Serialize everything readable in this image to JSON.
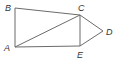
{
  "diagram": {
    "type": "geometry",
    "stroke_color": "#6b6b6b",
    "label_color": "#333333",
    "points": {
      "A": {
        "label": "A",
        "x": 15,
        "y": 47
      },
      "B": {
        "label": "B",
        "x": 15,
        "y": 8
      },
      "C": {
        "label": "C",
        "x": 80,
        "y": 15
      },
      "D": {
        "label": "D",
        "x": 103,
        "y": 31
      },
      "E": {
        "label": "E",
        "x": 80,
        "y": 46
      }
    },
    "segments": [
      [
        "B",
        "C"
      ],
      [
        "B",
        "A"
      ],
      [
        "A",
        "C"
      ],
      [
        "A",
        "E"
      ],
      [
        "C",
        "E"
      ],
      [
        "C",
        "D"
      ],
      [
        "E",
        "D"
      ]
    ]
  }
}
